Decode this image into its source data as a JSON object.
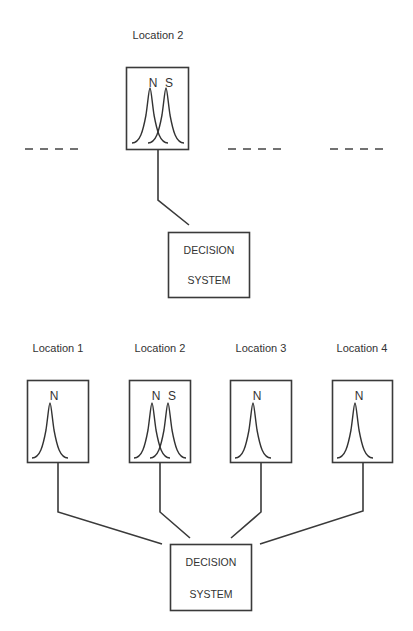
{
  "top_panel": {
    "location_label": "Location 2",
    "sensor": {
      "labels": [
        "N",
        "S"
      ]
    },
    "decision_box": {
      "line1": "DECISION",
      "line2": "SYSTEM"
    },
    "placeholders": [
      "- - - -",
      "- - - -",
      "- - - -"
    ]
  },
  "bottom_panel": {
    "locations": [
      {
        "label": "Location 1",
        "curves": [
          "N"
        ]
      },
      {
        "label": "Location 2",
        "curves": [
          "N",
          "S"
        ]
      },
      {
        "label": "Location 3",
        "curves": [
          "N"
        ]
      },
      {
        "label": "Location 4",
        "curves": [
          "N"
        ]
      }
    ],
    "decision_box": {
      "line1": "DECISION",
      "line2": "SYSTEM"
    }
  },
  "colors": {
    "line": "#3a3a3a",
    "text": "#333333",
    "background": "#ffffff"
  }
}
